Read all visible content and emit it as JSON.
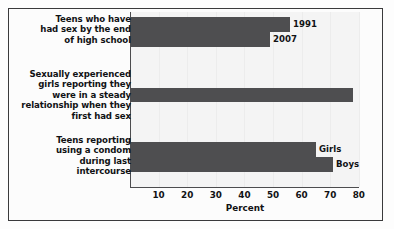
{
  "chart_data": {
    "type": "bar",
    "orientation": "horizontal",
    "title": "",
    "xlabel": "Percent",
    "ylabel": "",
    "xlim": [
      0,
      82
    ],
    "grid": true,
    "legend_position": "inline-right-of-bars",
    "xticks": [
      10,
      20,
      30,
      40,
      50,
      60,
      70,
      80
    ],
    "categories": [
      "Teens who have had sex by the end of high school",
      "Sexually experienced girls reporting they were in a steady relationship when they first had sex",
      "Teens reporting using a condom during last intercourse"
    ],
    "groups": [
      {
        "category_lines": [
          "Teens who have",
          "had sex by the end",
          "of high school"
        ],
        "bars": [
          {
            "label": "1991",
            "value": 56
          },
          {
            "label": "2007",
            "value": 49
          }
        ]
      },
      {
        "category_lines": [
          "Sexually experienced",
          "girls reporting they",
          "were in a steady",
          "relationship when they",
          "first had sex"
        ],
        "bars": [
          {
            "label": "",
            "value": 78
          }
        ]
      },
      {
        "category_lines": [
          "Teens reporting",
          "using a condom",
          "during last",
          "intercourse"
        ],
        "bars": [
          {
            "label": "Girls",
            "value": 65
          },
          {
            "label": "Boys",
            "value": 71
          }
        ]
      }
    ],
    "series": [
      {
        "name": "1991",
        "values": [
          56,
          null,
          null
        ]
      },
      {
        "name": "2007",
        "values": [
          49,
          null,
          null
        ]
      },
      {
        "name": "All",
        "values": [
          null,
          78,
          null
        ]
      },
      {
        "name": "Girls",
        "values": [
          null,
          null,
          65
        ]
      },
      {
        "name": "Boys",
        "values": [
          null,
          null,
          71
        ]
      }
    ],
    "bar_color": "#4e4e50",
    "plot_background": "#f4f4f4",
    "frame_color": "#3a3a3c"
  },
  "axis": {
    "x_title": "Percent",
    "ticks": [
      "10",
      "20",
      "30",
      "40",
      "50",
      "60",
      "70",
      "80"
    ]
  },
  "labels": {
    "g1_l1": "Teens who have",
    "g1_l2": "had sex by the end",
    "g1_l3": "of high school",
    "g2_l1": "Sexually experienced",
    "g2_l2": "girls reporting they",
    "g2_l3": "were in a steady",
    "g2_l4": "relationship when they",
    "g2_l5": "first had sex",
    "g3_l1": "Teens reporting",
    "g3_l2": "using a condom",
    "g3_l3": "during last",
    "g3_l4": "intercourse",
    "s_1991": "1991",
    "s_2007": "2007",
    "s_girls": "Girls",
    "s_boys": "Boys"
  }
}
